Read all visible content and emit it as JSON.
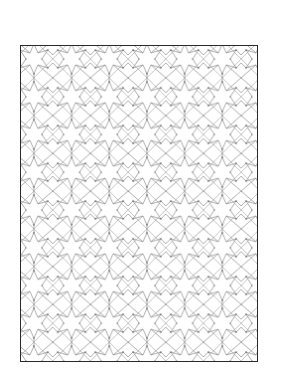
{
  "figure": {
    "pattern": {
      "motif": "eight-point-star-rosette",
      "tile_size_px": 38,
      "line_color": "#8a8a8a",
      "dot_color": "#444444",
      "border_color": "#2a2a2a",
      "background": "#ffffff"
    }
  }
}
